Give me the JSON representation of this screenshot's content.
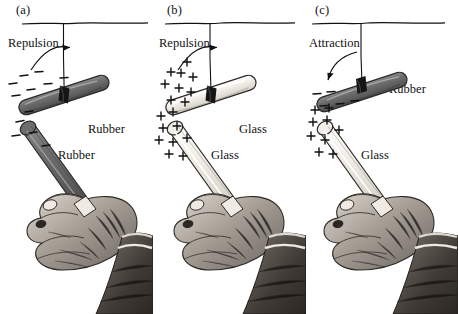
{
  "figure": {
    "style": "engraving",
    "background": "#ffffff",
    "panels": [
      {
        "id": "a",
        "panel_label": "(a)",
        "force_label": "Repulsion",
        "force_direction": "right",
        "suspended_rod": {
          "material_label": "Rubber",
          "charge_symbol": "−",
          "charge_sign": "negative",
          "color": "#6e6e6e",
          "tilt_deg": -18,
          "charge_count": 7
        },
        "handheld_rod": {
          "material_label": "Rubber",
          "charge_symbol": "−",
          "charge_sign": "negative",
          "color": "#6e6e6e",
          "charge_count": 5
        }
      },
      {
        "id": "b",
        "panel_label": "(b)",
        "force_label": "Repulsion",
        "force_direction": "right",
        "suspended_rod": {
          "material_label": "Glass",
          "charge_symbol": "+",
          "charge_sign": "positive",
          "color": "#ece9e0",
          "tilt_deg": -18,
          "charge_count": 9
        },
        "handheld_rod": {
          "material_label": "Glass",
          "charge_symbol": "+",
          "charge_sign": "positive",
          "color": "#ece9e0",
          "charge_count": 9
        }
      },
      {
        "id": "c",
        "panel_label": "(c)",
        "force_label": "Attraction",
        "force_direction": "left",
        "suspended_rod": {
          "material_label": "Rubber",
          "charge_symbol": "−",
          "charge_sign": "negative",
          "color": "#6e6e6e",
          "tilt_deg": 18,
          "charge_count": 5
        },
        "handheld_rod": {
          "material_label": "Glass",
          "charge_symbol": "+",
          "charge_sign": "positive",
          "color": "#ece9e0",
          "charge_count": 9
        }
      }
    ],
    "colors": {
      "ink": "#111111",
      "rubber": "#6e6e6e",
      "rubber_outline": "#2a2a2a",
      "glass": "#ece9e0",
      "glass_outline": "#2a2a2a",
      "skin_light": "#cfc9c1",
      "skin_mid": "#8d867e",
      "skin_dark": "#4a453f",
      "cuff_dark": "#3c3833"
    }
  }
}
